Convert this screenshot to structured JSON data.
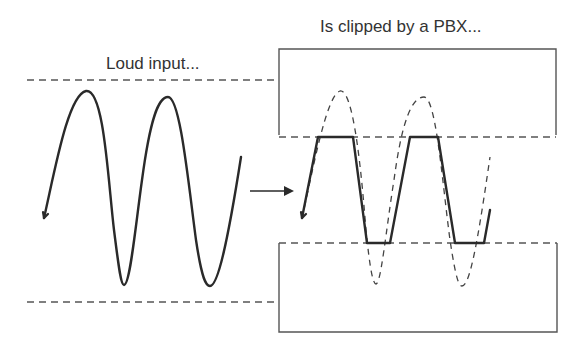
{
  "diagram": {
    "type": "signal-clipping-illustration",
    "left_panel": {
      "caption": "Loud input...",
      "waveform": "sine",
      "cycles": 2,
      "style": "solid"
    },
    "right_panel": {
      "caption": "Is clipped by a PBX...",
      "waveform": "clipped-sine",
      "clipped_regions": [
        "top",
        "bottom"
      ],
      "original_overlay_style": "dashed"
    },
    "connector": {
      "type": "arrow",
      "direction": "right"
    },
    "colors": {
      "stroke": "#2a2a2a",
      "guide": "#555555",
      "text": "#333333",
      "background": "#ffffff"
    }
  }
}
